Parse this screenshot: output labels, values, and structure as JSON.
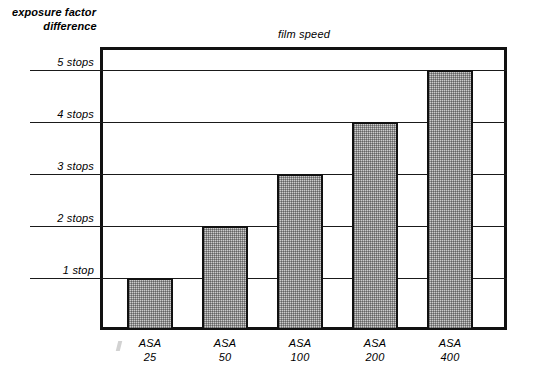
{
  "axis_caption": {
    "line1": "exposure factor",
    "line2": "difference"
  },
  "title": "film speed",
  "y_ticks": [
    {
      "label": "5 stops",
      "stops": 5
    },
    {
      "label": "4 stops",
      "stops": 4
    },
    {
      "label": "3 stops",
      "stops": 3
    },
    {
      "label": "2 stops",
      "stops": 2
    },
    {
      "label": "1 stop",
      "stops": 1
    }
  ],
  "x_ticks": [
    {
      "name": "ASA",
      "value": "25"
    },
    {
      "name": "ASA",
      "value": "50"
    },
    {
      "name": "ASA",
      "value": "100"
    },
    {
      "name": "ASA",
      "value": "200"
    },
    {
      "name": "ASA",
      "value": "400"
    }
  ],
  "colors": {
    "bar_fill": "#cccccc",
    "bar_outline": "#111111",
    "frame": "#111111",
    "gridline": "#1a1a1a",
    "background": "#ffffff",
    "text": "#000000"
  },
  "chart_data": {
    "type": "bar",
    "title": "film speed",
    "xlabel": "film speed",
    "ylabel": "exposure factor difference",
    "categories": [
      "ASA 25",
      "ASA 50",
      "ASA 100",
      "ASA 200",
      "ASA 400"
    ],
    "values": [
      1,
      2,
      3,
      4,
      5
    ],
    "value_unit": "stops",
    "tick_labels_y": [
      "1 stop",
      "2 stops",
      "3 stops",
      "4 stops",
      "5 stops"
    ],
    "tick_labels_x": [
      "ASA 25",
      "ASA 50",
      "ASA 100",
      "ASA 200",
      "ASA 400"
    ],
    "ylim": [
      0,
      5.45
    ],
    "grid": true,
    "legend": "none",
    "series": [
      {
        "name": "exposure factor difference",
        "values": [
          1,
          2,
          3,
          4,
          5
        ]
      }
    ]
  }
}
